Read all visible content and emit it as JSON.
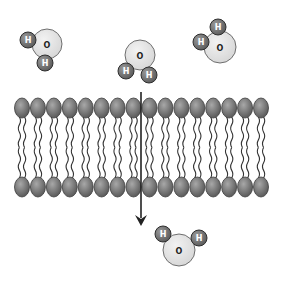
{
  "diagram": {
    "type": "lipid-bilayer-water-diffusion",
    "colors": {
      "background": "#ffffff",
      "oxygen_fill": "#d6d6d6",
      "oxygen_stroke": "#6e6e6e",
      "hydrogen_fill": "#5a5a5a",
      "hydrogen_stroke": "#2e2e2e",
      "hydrogen_text": "#ffffff",
      "oxygen_text": "#222222",
      "lipid_head_fill": "#7a7a7a",
      "lipid_head_stroke": "#3c3c3c",
      "lipid_tail": "#333333",
      "arrow": "#222222"
    },
    "labels": {
      "oxygen": "O",
      "hydrogen": "H"
    },
    "molecules": [
      {
        "name": "water-molecule-top-left",
        "o": {
          "x": 47,
          "y": 44,
          "r": 15
        },
        "h": [
          {
            "x": 28,
            "y": 40
          },
          {
            "x": 45,
            "y": 63
          }
        ]
      },
      {
        "name": "water-molecule-entering",
        "o": {
          "x": 140,
          "y": 55,
          "r": 15
        },
        "h": [
          {
            "x": 126,
            "y": 71
          },
          {
            "x": 149,
            "y": 75
          }
        ]
      },
      {
        "name": "water-molecule-top-right",
        "o": {
          "x": 220,
          "y": 47,
          "r": 16
        },
        "h": [
          {
            "x": 201,
            "y": 42
          },
          {
            "x": 218,
            "y": 27
          }
        ]
      },
      {
        "name": "water-molecule-bottom",
        "o": {
          "x": 179,
          "y": 250,
          "r": 16
        },
        "h": [
          {
            "x": 163,
            "y": 234
          },
          {
            "x": 199,
            "y": 238
          }
        ]
      }
    ],
    "hydrogen_radius": 8,
    "bilayer": {
      "head_count_per_leaflet": 16,
      "x_start": 22,
      "x_end": 261,
      "top_head_y": 108,
      "bottom_head_y": 187,
      "head_rx": 7.5,
      "head_ry": 10
    },
    "arrow": {
      "x": 141,
      "y1": 92,
      "y2": 226
    }
  }
}
